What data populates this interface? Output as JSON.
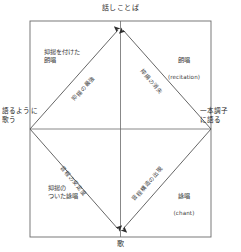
{
  "diagram": {
    "title_top": "話しことば",
    "title_bottom": "歌",
    "axis": {
      "left_label": "語るように\n歌う",
      "right_label": "一本調子\nに語る"
    },
    "quadrants": [
      {
        "id": "top-left",
        "label": "抑揚を付けた\n朗唱",
        "english": ""
      },
      {
        "id": "top-right",
        "label": "朗唱",
        "english": "(recitation)"
      },
      {
        "id": "bottom-left",
        "label": "抑揚の\nついた詠唱",
        "english": ""
      },
      {
        "id": "bottom-right",
        "label": "詠唱",
        "english": "(chant)"
      }
    ],
    "diagonal_labels": [
      {
        "id": "upper-left-diagonal",
        "text": "抑揚の最強"
      },
      {
        "id": "upper-right-diagonal",
        "text": "抑揚の消失"
      },
      {
        "id": "lower-left-diagonal",
        "text": "音程の安定度"
      },
      {
        "id": "lower-right-diagonal",
        "text": "音程構造の出現"
      }
    ],
    "colors": {
      "line": "#555555",
      "frame": "#666666",
      "text": "#2b2b2b"
    }
  }
}
